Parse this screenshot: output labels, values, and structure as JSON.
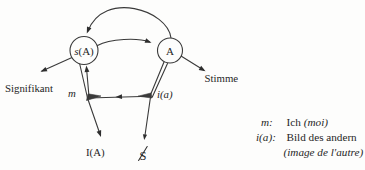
{
  "figure": {
    "background": "#fdfdfc",
    "ink": "#2e2e2e",
    "nodes": {
      "sA": {
        "symbol_italic": "s",
        "symbol_roman": "(A)"
      },
      "A": {
        "symbol": "A"
      }
    },
    "labels": {
      "signifikant": "Signifikant",
      "stimme": "Stimme",
      "m": "m",
      "i_a": "i(a)",
      "I_A": "I(A)",
      "barred_s": "S"
    },
    "edges": [
      {
        "from": "A",
        "to": "s(A)",
        "style": "large arc over the top, arrow into s(A)"
      },
      {
        "from": "s(A)",
        "to": "A",
        "style": "shallow arc, arrow into A"
      },
      {
        "from": "s(A)",
        "to": "Signifikant",
        "style": "straight line, arrow at Signifikant"
      },
      {
        "from": "A",
        "to": "Stimme",
        "style": "straight line, arrow at Stimme"
      },
      {
        "from": "A",
        "to": "s(A)",
        "style": "lower U-path through i(a) and m junctions, leftward mid arrow, arrow up into s(A)"
      },
      {
        "from": "m junction",
        "to": "I(A)",
        "style": "straight line, arrow down at I(A)"
      },
      {
        "from": "i(a) junction",
        "to": "S-barred",
        "style": "straight line, arrow down at S-barred"
      }
    ]
  },
  "legend": {
    "rows": [
      {
        "symbol": "m:",
        "text": "Ich",
        "text_italic": "(moi)"
      },
      {
        "symbol": "i(a):",
        "text": "Bild des andern",
        "text_italic": ""
      },
      {
        "symbol": "",
        "text": "",
        "text_italic": "(image de l'autre)"
      }
    ]
  }
}
